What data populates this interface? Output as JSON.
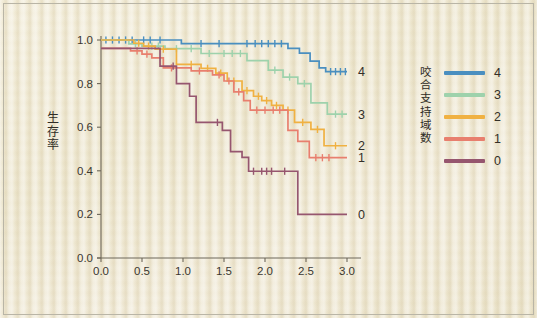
{
  "chart_data": {
    "type": "line",
    "title": "",
    "xlabel": "",
    "ylabel": "生存率",
    "xlim": [
      0.0,
      3.0
    ],
    "ylim": [
      0.0,
      1.0
    ],
    "xticks": [
      "0.0",
      "0.5",
      "1.0",
      "1.5",
      "2.0",
      "2.5",
      "3.0"
    ],
    "yticks": [
      "0.0",
      "0.2",
      "0.4",
      "0.6",
      "0.8",
      "1.0"
    ],
    "xtick_values": [
      0.0,
      0.5,
      1.0,
      1.5,
      2.0,
      2.5,
      3.0
    ],
    "ytick_values": [
      0.0,
      0.2,
      0.4,
      0.6,
      0.8,
      1.0
    ],
    "grid": false,
    "legend_position": "right",
    "legend_title": "咬合支持域数",
    "curve_style": "kaplan-meier step",
    "series": [
      {
        "name": "4",
        "color": "#4a8fc0",
        "end_label": "4",
        "end_value": 0.855,
        "steps": [
          [
            0.0,
            1.0
          ],
          [
            0.98,
            1.0
          ],
          [
            0.98,
            0.983
          ],
          [
            2.28,
            0.983
          ],
          [
            2.28,
            0.962
          ],
          [
            2.42,
            0.962
          ],
          [
            2.42,
            0.94
          ],
          [
            2.55,
            0.94
          ],
          [
            2.55,
            0.903
          ],
          [
            2.66,
            0.903
          ],
          [
            2.66,
            0.872
          ],
          [
            2.74,
            0.872
          ],
          [
            2.74,
            0.855
          ],
          [
            3.0,
            0.855
          ]
        ],
        "censors": [
          0.06,
          0.14,
          0.22,
          0.3,
          0.38,
          0.52,
          0.6,
          0.72,
          1.22,
          1.44,
          1.78,
          1.88,
          1.96,
          2.04,
          2.12,
          2.2,
          2.8,
          2.86,
          2.92,
          2.98
        ]
      },
      {
        "name": "3",
        "color": "#9ed2ac",
        "end_label": "3",
        "end_value": 0.66,
        "steps": [
          [
            0.0,
            1.0
          ],
          [
            0.34,
            1.0
          ],
          [
            0.34,
            0.982
          ],
          [
            0.5,
            0.982
          ],
          [
            0.5,
            0.972
          ],
          [
            0.78,
            0.972
          ],
          [
            0.78,
            0.96
          ],
          [
            1.22,
            0.96
          ],
          [
            1.22,
            0.938
          ],
          [
            1.78,
            0.938
          ],
          [
            1.78,
            0.905
          ],
          [
            2.04,
            0.905
          ],
          [
            2.04,
            0.862
          ],
          [
            2.22,
            0.862
          ],
          [
            2.22,
            0.83
          ],
          [
            2.4,
            0.83
          ],
          [
            2.4,
            0.8
          ],
          [
            2.56,
            0.8
          ],
          [
            2.56,
            0.712
          ],
          [
            2.76,
            0.712
          ],
          [
            2.76,
            0.66
          ],
          [
            3.0,
            0.66
          ]
        ],
        "censors": [
          0.42,
          0.62,
          0.7,
          0.92,
          1.1,
          1.32,
          1.5,
          1.6,
          1.7,
          2.12,
          2.3,
          2.48,
          2.86,
          2.94
        ]
      },
      {
        "name": "2",
        "color": "#f0b142",
        "end_label": "2",
        "end_value": 0.515,
        "steps": [
          [
            0.0,
            1.0
          ],
          [
            0.4,
            1.0
          ],
          [
            0.4,
            0.985
          ],
          [
            0.52,
            0.985
          ],
          [
            0.52,
            0.972
          ],
          [
            0.66,
            0.972
          ],
          [
            0.66,
            0.958
          ],
          [
            0.92,
            0.958
          ],
          [
            0.92,
            0.888
          ],
          [
            1.22,
            0.888
          ],
          [
            1.22,
            0.87
          ],
          [
            1.4,
            0.87
          ],
          [
            1.4,
            0.848
          ],
          [
            1.54,
            0.848
          ],
          [
            1.54,
            0.812
          ],
          [
            1.72,
            0.812
          ],
          [
            1.72,
            0.768
          ],
          [
            1.86,
            0.768
          ],
          [
            1.86,
            0.742
          ],
          [
            1.96,
            0.742
          ],
          [
            1.96,
            0.722
          ],
          [
            2.08,
            0.722
          ],
          [
            2.08,
            0.7
          ],
          [
            2.22,
            0.7
          ],
          [
            2.22,
            0.678
          ],
          [
            2.36,
            0.678
          ],
          [
            2.36,
            0.622
          ],
          [
            2.56,
            0.622
          ],
          [
            2.56,
            0.59
          ],
          [
            2.72,
            0.59
          ],
          [
            2.72,
            0.515
          ],
          [
            3.0,
            0.515
          ]
        ],
        "censors": [
          0.46,
          0.58,
          0.76,
          1.1,
          1.3,
          1.46,
          1.62,
          1.78,
          1.92,
          2.02,
          2.14,
          2.28,
          2.46,
          2.64,
          2.86
        ]
      },
      {
        "name": "1",
        "color": "#e87f6e",
        "end_label": "1",
        "end_value": 0.46,
        "steps": [
          [
            0.0,
            0.962
          ],
          [
            0.36,
            0.962
          ],
          [
            0.36,
            0.95
          ],
          [
            0.5,
            0.95
          ],
          [
            0.5,
            0.935
          ],
          [
            0.62,
            0.935
          ],
          [
            0.62,
            0.918
          ],
          [
            0.76,
            0.918
          ],
          [
            0.76,
            0.872
          ],
          [
            1.1,
            0.872
          ],
          [
            1.1,
            0.858
          ],
          [
            1.36,
            0.858
          ],
          [
            1.36,
            0.84
          ],
          [
            1.5,
            0.84
          ],
          [
            1.5,
            0.812
          ],
          [
            1.62,
            0.812
          ],
          [
            1.62,
            0.762
          ],
          [
            1.74,
            0.762
          ],
          [
            1.74,
            0.722
          ],
          [
            1.82,
            0.722
          ],
          [
            1.82,
            0.678
          ],
          [
            2.28,
            0.678
          ],
          [
            2.28,
            0.585
          ],
          [
            2.4,
            0.585
          ],
          [
            2.4,
            0.535
          ],
          [
            2.54,
            0.535
          ],
          [
            2.54,
            0.46
          ],
          [
            3.0,
            0.46
          ]
        ],
        "censors": [
          0.44,
          0.56,
          0.86,
          1.2,
          1.44,
          1.56,
          1.68,
          1.9,
          2.0,
          2.1,
          2.18,
          2.62,
          2.7,
          2.78
        ]
      },
      {
        "name": "0",
        "color": "#96566f",
        "end_label": "0",
        "end_value": 0.2,
        "steps": [
          [
            0.0,
            0.962
          ],
          [
            0.72,
            0.962
          ],
          [
            0.72,
            0.88
          ],
          [
            0.92,
            0.88
          ],
          [
            0.92,
            0.8
          ],
          [
            1.08,
            0.8
          ],
          [
            1.08,
            0.742
          ],
          [
            1.16,
            0.742
          ],
          [
            1.16,
            0.622
          ],
          [
            1.48,
            0.622
          ],
          [
            1.48,
            0.585
          ],
          [
            1.58,
            0.585
          ],
          [
            1.58,
            0.488
          ],
          [
            1.72,
            0.488
          ],
          [
            1.72,
            0.462
          ],
          [
            1.8,
            0.462
          ],
          [
            1.8,
            0.398
          ],
          [
            2.4,
            0.398
          ],
          [
            2.4,
            0.2
          ],
          [
            3.0,
            0.2
          ]
        ],
        "censors": [
          0.88,
          1.42,
          1.86,
          1.96,
          2.02,
          2.08,
          2.24
        ]
      }
    ]
  },
  "legend": {
    "title": "咬合支持域数",
    "title_chars": [
      "咬",
      "合",
      "支",
      "持",
      "域",
      "数"
    ],
    "items": [
      {
        "label": "4",
        "color": "#4a8fc0"
      },
      {
        "label": "3",
        "color": "#9ed2ac"
      },
      {
        "label": "2",
        "color": "#f0b142"
      },
      {
        "label": "1",
        "color": "#e87f6e"
      },
      {
        "label": "0",
        "color": "#96566f"
      }
    ]
  },
  "axes": {
    "y_title": "生存率",
    "y_title_chars": [
      "生",
      "存",
      "率"
    ]
  }
}
